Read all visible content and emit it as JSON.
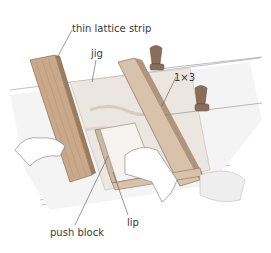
{
  "figure": {
    "labels": {
      "thin_lattice_strip": "thin lattice strip",
      "jig": "jig",
      "one_by_three": "1×3",
      "push_block": "push block",
      "lip": "lip"
    },
    "colors": {
      "wood": "#c9a98a",
      "wood_dark": "#9c7c5e",
      "table": "#f2f2f2",
      "clamp": "#8a6e5a",
      "line": "#555555",
      "text": "#3a3a3a"
    }
  }
}
